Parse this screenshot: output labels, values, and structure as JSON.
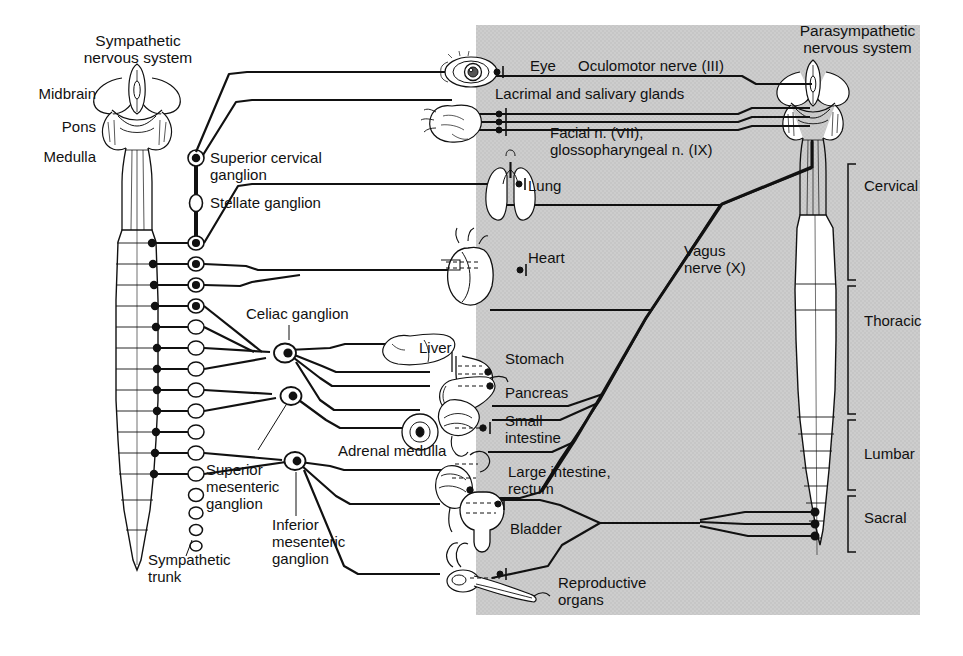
{
  "figure": {
    "title_left": "Sympathetic\nnervous system",
    "title_right": "Parasympathetic\nnervous system",
    "background_panel_color": "#cfcfcf",
    "page_color": "#ffffff",
    "ink_color": "#111111"
  },
  "left_brain_labels": [
    {
      "id": "midbrain",
      "text": "Midbrain"
    },
    {
      "id": "pons",
      "text": "Pons"
    },
    {
      "id": "medulla",
      "text": "Medulla"
    }
  ],
  "sympathetic_ganglia": [
    {
      "id": "superior-cervical-ganglion",
      "text": "Superior cervical\nganglion"
    },
    {
      "id": "stellate-ganglion",
      "text": "Stellate ganglion"
    },
    {
      "id": "celiac-ganglion",
      "text": "Celiac ganglion"
    },
    {
      "id": "superior-mesenteric-ganglion",
      "text": "Superior\nmesenteric\nganglion"
    },
    {
      "id": "inferior-mesenteric-ganglion",
      "text": "Inferior\nmesenteric\nganglion"
    },
    {
      "id": "sympathetic-trunk",
      "text": "Sympathetic\ntrunk"
    }
  ],
  "organs": [
    {
      "id": "eye",
      "text": "Eye"
    },
    {
      "id": "lacrimal-salivary",
      "text": "Lacrimal and salivary glands"
    },
    {
      "id": "lung",
      "text": "Lung"
    },
    {
      "id": "heart",
      "text": "Heart"
    },
    {
      "id": "liver",
      "text": "Liver"
    },
    {
      "id": "stomach",
      "text": "Stomach"
    },
    {
      "id": "pancreas",
      "text": "Pancreas"
    },
    {
      "id": "small-intestine",
      "text": "Small\nintestine"
    },
    {
      "id": "adrenal-medulla",
      "text": "Adrenal medulla"
    },
    {
      "id": "large-intestine-rectum",
      "text": "Large intestine,\nrectum"
    },
    {
      "id": "bladder",
      "text": "Bladder"
    },
    {
      "id": "reproductive-organs",
      "text": "Reproductive\norgans"
    }
  ],
  "cranial_nerves": [
    {
      "id": "oculomotor",
      "text": "Oculomotor nerve (III)"
    },
    {
      "id": "facial-glossopharyngeal",
      "text": "Facial n. (VII),\nglossopharyngeal n. (IX)"
    },
    {
      "id": "vagus",
      "text": "Vagus\nnerve (X)"
    }
  ],
  "spinal_regions": [
    {
      "id": "cervical",
      "text": "Cervical"
    },
    {
      "id": "thoracic",
      "text": "Thoracic"
    },
    {
      "id": "lumbar",
      "text": "Lumbar"
    },
    {
      "id": "sacral",
      "text": "Sacral"
    }
  ]
}
